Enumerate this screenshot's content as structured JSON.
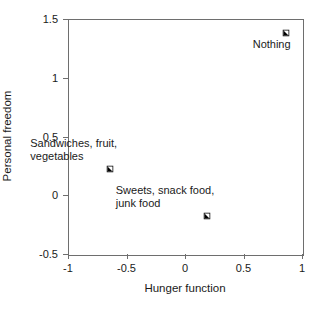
{
  "chart_data": {
    "type": "scatter",
    "title": "",
    "xlabel": "Hunger function",
    "ylabel": "Personal freedom",
    "xlim": [
      -1,
      1
    ],
    "ylim": [
      -0.5,
      1.5
    ],
    "xticks": [
      "-1",
      "-0.5",
      "0",
      "0.5",
      "1"
    ],
    "xtick_values": [
      -1,
      -0.5,
      0,
      0.5,
      1
    ],
    "yticks": [
      "-0.5",
      "0",
      "0.5",
      "1",
      "1.5"
    ],
    "ytick_values": [
      -0.5,
      0,
      0.5,
      1,
      1.5
    ],
    "grid": false,
    "legend": "none",
    "marker_style": "square-half-filled-lower-left",
    "marker_color": "#000000",
    "points": [
      {
        "label": "Nothing",
        "label_lines": [
          "Nothing"
        ],
        "x": 0.86,
        "y": 1.38,
        "label_position": "below-left"
      },
      {
        "label": "Sandwiches, fruit, vegetables",
        "label_lines": [
          "Sandwiches, fruit,",
          "vegetables"
        ],
        "x": -0.64,
        "y": 0.22,
        "label_position": "above-left"
      },
      {
        "label": "Sweets, snack food, junk food",
        "label_lines": [
          "Sweets, snack food,",
          "junk food"
        ],
        "x": 0.19,
        "y": -0.18,
        "label_position": "above-left"
      }
    ]
  },
  "colors": {
    "axis": "#6e6e6e",
    "text": "#1a1a1a",
    "marker": "#000000",
    "background": "#ffffff"
  }
}
